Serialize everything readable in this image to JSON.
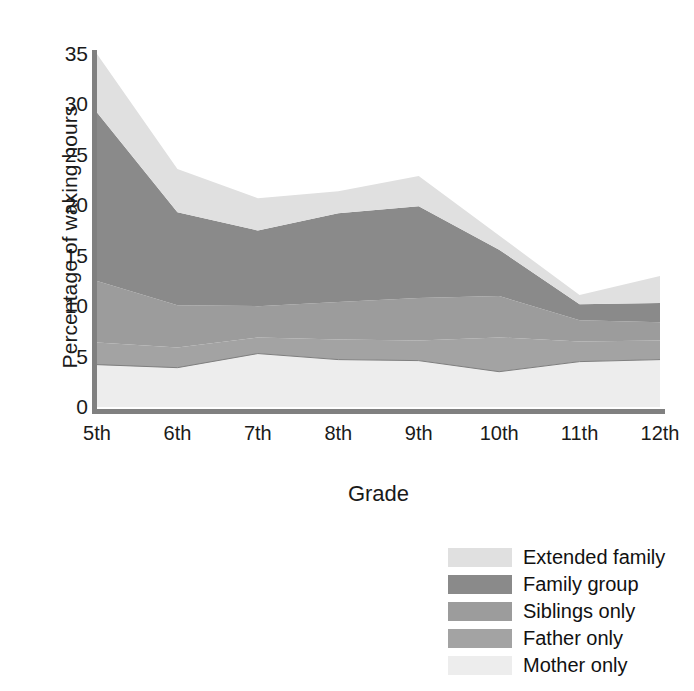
{
  "chart_data": {
    "type": "area",
    "stacked": true,
    "title": "",
    "xlabel": "Grade",
    "ylabel": "Percentage of waking hours",
    "categories": [
      "5th",
      "6th",
      "7th",
      "8th",
      "9th",
      "10th",
      "11th",
      "12th"
    ],
    "x_tick_labels": [
      "5th",
      "6th",
      "7th",
      "8th",
      "9th",
      "10th",
      "11th",
      "12th"
    ],
    "y_tick_labels": [
      "0",
      "5",
      "10",
      "15",
      "20",
      "25",
      "30",
      "35"
    ],
    "y_ticks": [
      0,
      5,
      10,
      15,
      20,
      25,
      30,
      35
    ],
    "ylim": [
      0,
      35
    ],
    "grid": false,
    "legend_position": "below-right",
    "series": [
      {
        "name": "Mother only",
        "color": "#ededed",
        "values": [
          4.2,
          3.9,
          5.3,
          4.7,
          4.6,
          3.5,
          4.5,
          4.7
        ]
      },
      {
        "name": "Father only",
        "color": "#a3a3a3",
        "values": [
          2.2,
          2.0,
          1.6,
          2.0,
          2.0,
          3.4,
          2.0,
          1.9
        ]
      },
      {
        "name": "Siblings only",
        "color": "#9c9c9c",
        "values": [
          6.1,
          4.2,
          3.1,
          3.7,
          4.2,
          4.1,
          2.1,
          1.8
        ]
      },
      {
        "name": "Family group",
        "color": "#8a8a8a",
        "values": [
          16.7,
          9.2,
          7.5,
          8.8,
          9.1,
          4.6,
          1.6,
          1.9
        ]
      },
      {
        "name": "Extended family",
        "color": "#e0e0e0",
        "values": [
          5.8,
          4.3,
          3.2,
          2.2,
          3.0,
          1.4,
          0.9,
          2.7
        ]
      }
    ],
    "cumulative_tops": {
      "Mother only": [
        4.2,
        3.9,
        5.3,
        4.7,
        4.6,
        3.5,
        4.5,
        4.7
      ],
      "Father only": [
        6.4,
        5.9,
        6.9,
        6.7,
        6.6,
        6.9,
        6.5,
        6.6
      ],
      "Siblings only": [
        12.5,
        10.1,
        10.0,
        10.4,
        10.8,
        11.0,
        8.6,
        8.4
      ],
      "Family group": [
        29.2,
        19.3,
        17.5,
        19.2,
        19.9,
        15.6,
        10.2,
        10.3
      ],
      "Extended family": [
        35.0,
        23.6,
        20.7,
        21.4,
        22.9,
        17.0,
        11.1,
        13.0
      ]
    }
  },
  "axes": {
    "ylabel": "Percentage of waking hours",
    "xlabel": "Grade"
  },
  "legend": {
    "items": [
      {
        "label": "Extended family",
        "color": "#e0e0e0"
      },
      {
        "label": "Family group",
        "color": "#8a8a8a"
      },
      {
        "label": "Siblings only",
        "color": "#9c9c9c"
      },
      {
        "label": "Father only",
        "color": "#a3a3a3"
      },
      {
        "label": "Mother only",
        "color": "#ededed"
      }
    ]
  },
  "style": {
    "axis_color": "#808080",
    "text_color": "#1a1a1a",
    "background": "#ffffff"
  }
}
